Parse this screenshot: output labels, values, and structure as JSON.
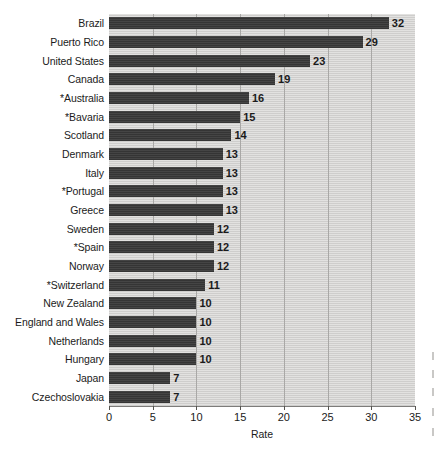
{
  "chart_data": {
    "type": "bar",
    "orientation": "horizontal",
    "title": "",
    "xlabel": "Rate",
    "ylabel": "",
    "xlim": [
      0,
      35
    ],
    "xticks": [
      0,
      5,
      10,
      15,
      20,
      25,
      30,
      35
    ],
    "grid": true,
    "legend": null,
    "value_labels": true,
    "categories": [
      "Brazil",
      "Puerto Rico",
      "United States",
      "Canada",
      "*Australia",
      "*Bavaria",
      "Scotland",
      "Denmark",
      "Italy",
      "*Portugal",
      "Greece",
      "Sweden",
      "*Spain",
      "Norway",
      "*Switzerland",
      "New Zealand",
      "England and Wales",
      "Netherlands",
      "Hungary",
      "Japan",
      "Czechoslovakia"
    ],
    "values": [
      32,
      29,
      23,
      19,
      16,
      15,
      14,
      13,
      13,
      13,
      13,
      12,
      12,
      12,
      11,
      10,
      10,
      10,
      10,
      7,
      7
    ],
    "colors": {
      "bar": "#3b3b3b",
      "plot_background": "#d6d5d3",
      "gridline": "#a9a8a6",
      "text": "#1b1b1b",
      "axis": "#7d7c7a"
    }
  }
}
